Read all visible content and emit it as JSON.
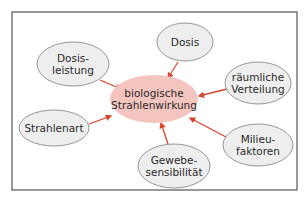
{
  "diagram": {
    "frame": {
      "x": 12,
      "y": 12,
      "w": 285,
      "h": 178,
      "stroke": "#555555"
    },
    "colors": {
      "arrow": "#d9442e",
      "node_fill": "#eeeeee",
      "node_stroke": "#8a8a8a",
      "center_fill": "#f4c4bf"
    },
    "center": {
      "lines": [
        "biologische",
        "Strahlenwirkung"
      ],
      "cx": 154,
      "cy": 99,
      "rx": 44,
      "ry": 24
    },
    "nodes": [
      {
        "id": "dosis",
        "lines": [
          "Dosis"
        ],
        "cx": 185,
        "cy": 42,
        "rx": 28,
        "ry": 19
      },
      {
        "id": "dosisleistung",
        "lines": [
          "Dosis-",
          "leistung"
        ],
        "cx": 73,
        "cy": 64,
        "rx": 36,
        "ry": 22
      },
      {
        "id": "raeumliche-verteilung",
        "lines": [
          "räumliche",
          "Verteilung"
        ],
        "cx": 258,
        "cy": 83,
        "rx": 33,
        "ry": 21
      },
      {
        "id": "strahlenart",
        "lines": [
          "Strahlenart"
        ],
        "cx": 54,
        "cy": 128,
        "rx": 35,
        "ry": 18
      },
      {
        "id": "milieufaktoren",
        "lines": [
          "Milieu-",
          "faktoren"
        ],
        "cx": 258,
        "cy": 145,
        "rx": 35,
        "ry": 21
      },
      {
        "id": "gewebesensibilitaet",
        "lines": [
          "Gewebe-",
          "sensibilität"
        ],
        "cx": 174,
        "cy": 166,
        "rx": 36,
        "ry": 22
      }
    ],
    "arrows": [
      {
        "from": "dosis",
        "x1": 178,
        "y1": 62,
        "x2": 168,
        "y2": 78
      },
      {
        "from": "dosisleistung",
        "x1": 100,
        "y1": 80,
        "x2": 121,
        "y2": 89
      },
      {
        "from": "raeumliche-verteilung",
        "x1": 227,
        "y1": 89,
        "x2": 199,
        "y2": 96
      },
      {
        "from": "strahlenart",
        "x1": 89,
        "y1": 124,
        "x2": 111,
        "y2": 116
      },
      {
        "from": "milieufaktoren",
        "x1": 226,
        "y1": 137,
        "x2": 190,
        "y2": 118
      },
      {
        "from": "gewebesensibilitaet",
        "x1": 168,
        "y1": 144,
        "x2": 161,
        "y2": 123
      }
    ]
  }
}
